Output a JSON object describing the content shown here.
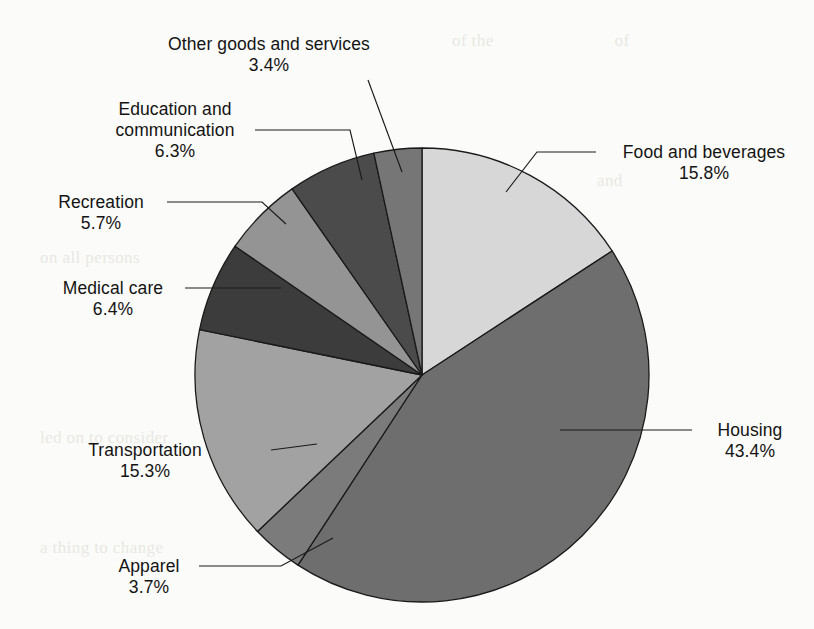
{
  "chart_data": {
    "type": "pie",
    "title": "",
    "subtitle": "",
    "xlabel": "",
    "ylabel": "",
    "legend_position": "none",
    "grid": false,
    "units": "percent",
    "start_angle_deg": 0,
    "direction": "clockwise",
    "categories": [
      "Food and beverages",
      "Housing",
      "Apparel",
      "Transportation",
      "Medical care",
      "Recreation",
      "Education and communication",
      "Other goods and services"
    ],
    "values": [
      15.8,
      43.4,
      3.7,
      15.3,
      6.4,
      5.7,
      6.3,
      3.4
    ],
    "slices": [
      {
        "label": "Food and beverages",
        "percent": "15.8%",
        "value": 15.8,
        "color": "#d7d7d7",
        "start_deg": 0.0,
        "end_deg": 56.88
      },
      {
        "label": "Housing",
        "percent": "43.4%",
        "value": 43.4,
        "color": "#6e6e6e",
        "start_deg": 56.88,
        "end_deg": 213.12
      },
      {
        "label": "Apparel",
        "percent": "3.7%",
        "value": 3.7,
        "color": "#7b7b7b",
        "start_deg": 213.12,
        "end_deg": 226.44
      },
      {
        "label": "Transportation",
        "percent": "15.3%",
        "value": 15.3,
        "color": "#a2a2a2",
        "start_deg": 226.44,
        "end_deg": 281.52
      },
      {
        "label": "Medical care",
        "percent": "6.4%",
        "value": 6.4,
        "color": "#3c3c3c",
        "start_deg": 281.52,
        "end_deg": 304.56
      },
      {
        "label": "Recreation",
        "percent": "5.7%",
        "value": 5.7,
        "color": "#949494",
        "start_deg": 304.56,
        "end_deg": 325.08
      },
      {
        "label": "Education and communication",
        "percent": "6.3%",
        "value": 6.3,
        "color": "#4b4b4b",
        "start_deg": 325.08,
        "end_deg": 347.76
      },
      {
        "label": "Other goods and services",
        "percent": "3.4%",
        "value": 3.4,
        "color": "#767676",
        "start_deg": 347.76,
        "end_deg": 360.0
      }
    ]
  },
  "labels": {
    "other_goods": {
      "name": "Other goods and services",
      "percent": "3.4%"
    },
    "education": {
      "name_line1": "Education and",
      "name_line2": "communication",
      "percent": "6.3%"
    },
    "recreation": {
      "name": "Recreation",
      "percent": "5.7%"
    },
    "medical": {
      "name": "Medical care",
      "percent": "6.4%"
    },
    "transportation": {
      "name": "Transportation",
      "percent": "15.3%"
    },
    "apparel": {
      "name": "Apparel",
      "percent": "3.7%"
    },
    "food": {
      "name": "Food and beverages",
      "percent": "15.8%"
    },
    "housing": {
      "name": "Housing",
      "percent": "43.4%"
    }
  },
  "background_bleed": {
    "a": "of the                          of",
    "b": "from the                  and",
    "c": "the                   of the",
    "d": "a thing to change",
    "e": "on all persons",
    "f": "led on to consider",
    "g": "a thing to change"
  },
  "geometry": {
    "center_x": 422,
    "center_y": 375,
    "radius": 227
  },
  "colors": {
    "outline": "#1a1a1a",
    "leader_line": "#1a1a1a",
    "text": "#131313",
    "background": "#fbfbf9"
  }
}
